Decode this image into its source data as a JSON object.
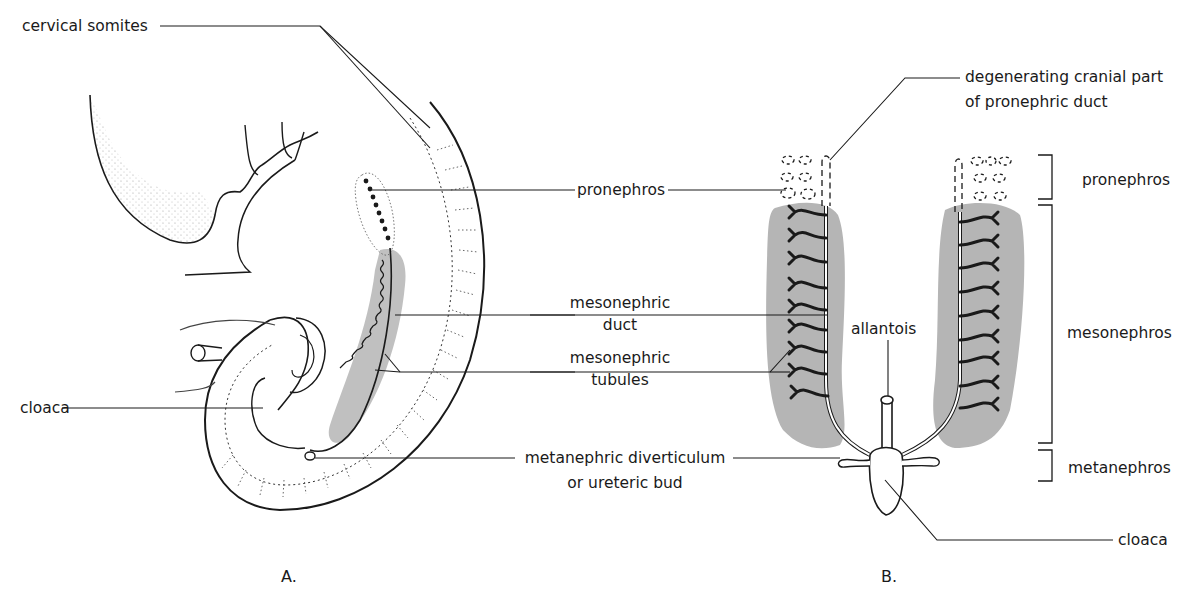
{
  "figure": {
    "panels": [
      {
        "id": "A",
        "caption": "A.",
        "view": "lateral view of embryo"
      },
      {
        "id": "B",
        "caption": "B.",
        "view": "ventral view of kidney systems"
      }
    ],
    "colors": {
      "ink": "#1a1a1a",
      "shading": "#b5b5b5",
      "background": "#ffffff"
    }
  },
  "labels": {
    "cervical_somites": "cervical somites",
    "cloaca_a": "cloaca",
    "pronephros_center": "pronephros",
    "mesonephric_duct_1": "mesonephric",
    "mesonephric_duct_2": "duct",
    "mesonephric_tubules_1": "mesonephric",
    "mesonephric_tubules_2": "tubules",
    "metanephric_1": "metanephric diverticulum",
    "metanephric_2": "or ureteric bud",
    "degenerating_1": "degenerating cranial part",
    "degenerating_2": "of pronephric duct",
    "allantois": "allantois",
    "pronephros_right": "pronephros",
    "mesonephros_right": "mesonephros",
    "metanephros_right": "metanephros",
    "cloaca_b": "cloaca"
  }
}
